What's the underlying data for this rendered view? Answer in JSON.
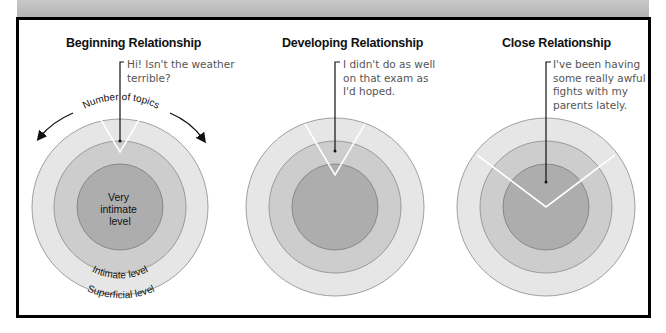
{
  "panels": [
    {
      "title": "Beginning Relationship",
      "quote": "Hi! Isn't the weather\nterrible?",
      "topics_label": "Number of topics",
      "levels": {
        "inner": [
          "Very",
          "intimate",
          "level"
        ],
        "middle": "Intimate level",
        "outer": "Superficial level"
      },
      "wedge_depth": "superficial"
    },
    {
      "title": "Developing Relationship",
      "quote": "I didn't do as well\non that exam as\nI'd hoped.",
      "wedge_depth": "intimate"
    },
    {
      "title": "Close Relationship",
      "quote": "I've been having\nsome really awful\nfights with my\nparents lately.",
      "wedge_depth": "very intimate"
    }
  ],
  "colors": {
    "outer_ring": "#e6e6e6",
    "middle_ring": "#cdcdcd",
    "inner_core": "#adadad",
    "ring_stroke": "#8a8a8a",
    "wedge_line": "#ffffff",
    "frame": "#000000",
    "top_band": "#bdbdbd"
  }
}
